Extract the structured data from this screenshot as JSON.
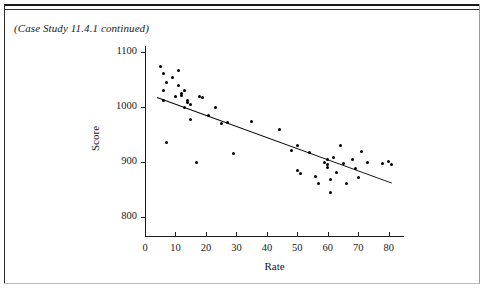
{
  "page": {
    "caption": "(Case Study 11.4.1 continued)"
  },
  "chart_data": {
    "type": "scatter",
    "title": "",
    "xlabel": "Rate",
    "ylabel": "Score",
    "xlim": [
      0,
      85
    ],
    "ylim": [
      780,
      1110
    ],
    "xticks": [
      0,
      10,
      20,
      30,
      40,
      50,
      60,
      70,
      80
    ],
    "yticks": [
      800,
      900,
      1000,
      1100
    ],
    "grid": false,
    "legend": null,
    "point_color": "#000000",
    "line_color": "#000000",
    "points": [
      [
        5,
        1075
      ],
      [
        6,
        1062
      ],
      [
        6,
        1030
      ],
      [
        6,
        1012
      ],
      [
        7,
        1045
      ],
      [
        7,
        935
      ],
      [
        9,
        1055
      ],
      [
        10,
        1020
      ],
      [
        11,
        1068
      ],
      [
        11,
        1040
      ],
      [
        12,
        1025
      ],
      [
        12,
        1022
      ],
      [
        13,
        1030
      ],
      [
        13,
        1000
      ],
      [
        14,
        1012
      ],
      [
        14,
        1008
      ],
      [
        15,
        1005
      ],
      [
        15,
        978
      ],
      [
        17,
        900
      ],
      [
        18,
        1020
      ],
      [
        19,
        1018
      ],
      [
        21,
        985
      ],
      [
        23,
        1000
      ],
      [
        25,
        970
      ],
      [
        27,
        972
      ],
      [
        29,
        915
      ],
      [
        35,
        975
      ],
      [
        44,
        960
      ],
      [
        48,
        922
      ],
      [
        50,
        930
      ],
      [
        50,
        885
      ],
      [
        51,
        880
      ],
      [
        54,
        918
      ],
      [
        56,
        873
      ],
      [
        57,
        862
      ],
      [
        59,
        900
      ],
      [
        60,
        905
      ],
      [
        60,
        895
      ],
      [
        60,
        890
      ],
      [
        61,
        868
      ],
      [
        61,
        845
      ],
      [
        62,
        908
      ],
      [
        63,
        882
      ],
      [
        64,
        930
      ],
      [
        65,
        898
      ],
      [
        66,
        862
      ],
      [
        68,
        905
      ],
      [
        69,
        888
      ],
      [
        70,
        872
      ],
      [
        71,
        920
      ],
      [
        73,
        900
      ],
      [
        78,
        898
      ],
      [
        80,
        902
      ],
      [
        81,
        895
      ]
    ],
    "fit_line": {
      "label": "least-squares regression line",
      "x_start": 4,
      "y_start": 1018,
      "x_end": 81,
      "y_end": 862
    }
  }
}
